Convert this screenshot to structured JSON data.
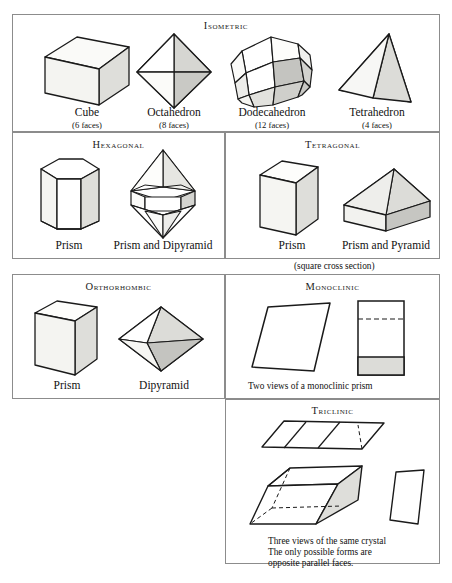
{
  "figure": {
    "stroke_color": "#1a1a1a",
    "border_color": "#8c8c8c",
    "fill_light": "#f2f2f0",
    "fill_mid": "#d9d9d6",
    "fill_dark": "#bdbdba",
    "fill_white": "#ffffff"
  },
  "panels": {
    "isometric": {
      "title": "Isometric",
      "shapes": [
        {
          "name": "Cube",
          "faces": "(6 faces)"
        },
        {
          "name": "Octahedron",
          "faces": "(8 faces)"
        },
        {
          "name": "Dodecahedron",
          "faces": "(12 faces)"
        },
        {
          "name": "Tetrahedron",
          "faces": "(4 faces)"
        }
      ]
    },
    "hexagonal": {
      "title": "Hexagonal",
      "shapes": [
        {
          "name": "Prism"
        },
        {
          "name": "Prism and Dipyramid"
        }
      ]
    },
    "tetragonal": {
      "title": "Tetragonal",
      "shapes": [
        {
          "name": "Prism"
        },
        {
          "name": "Prism and Pyramid"
        }
      ],
      "note": "(square cross section)"
    },
    "orthorhombic": {
      "title": "Orthorhombic",
      "shapes": [
        {
          "name": "Prism"
        },
        {
          "name": "Dipyramid"
        }
      ]
    },
    "monoclinic": {
      "title": "Monoclinic",
      "note": "Two views of a monoclinic prism"
    },
    "triclinic": {
      "title": "Triclinic",
      "note_line1": "Three views of the same crystal",
      "note_line2": "The only possible forms are",
      "note_line3": "opposite parallel faces."
    }
  }
}
